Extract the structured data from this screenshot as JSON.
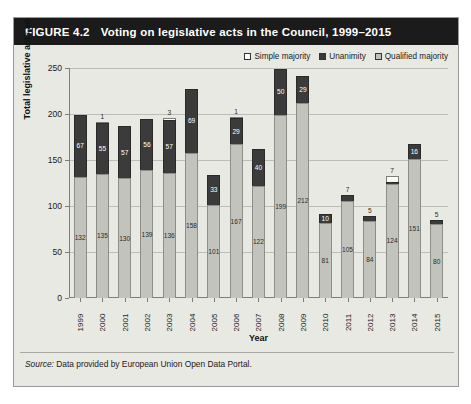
{
  "figure": {
    "number": "FIGURE 4.2",
    "title": "Voting on legislative acts in the Council, 1999–2015",
    "source_word": "Source:",
    "source_text": " Data provided by European Union Open Data Portal."
  },
  "legend": {
    "items": [
      {
        "label": "Simple majority",
        "color": "#ffffff",
        "key": "simple"
      },
      {
        "label": "Unanimity",
        "color": "#3a3a3a",
        "key": "unanimity"
      },
      {
        "label": "Qualified majority",
        "color": "#c0c0bb",
        "key": "qualified"
      }
    ]
  },
  "chart_data": {
    "type": "bar",
    "stacked": true,
    "title": "Voting on legislative acts in the Council, 1999–2015",
    "xlabel": "Year",
    "ylabel": "Total legislative acts adopted",
    "ylim": [
      0,
      250
    ],
    "yticks": [
      0,
      50,
      100,
      150,
      200,
      250
    ],
    "grid": true,
    "legend_position": "top-right",
    "categories": [
      "1999",
      "2000",
      "2001",
      "2002",
      "2003",
      "2004",
      "2005",
      "2006",
      "2007",
      "2008",
      "2009",
      "2010",
      "2011",
      "2012",
      "2013",
      "2014",
      "2015"
    ],
    "series": [
      {
        "name": "Qualified majority",
        "color": "#c3c3be",
        "values": [
          132,
          135,
          130,
          139,
          136,
          158,
          101,
          167,
          122,
          199,
          212,
          81,
          105,
          84,
          124,
          151,
          80
        ]
      },
      {
        "name": "Unanimity",
        "color": "#3b3b3b",
        "values": [
          67,
          55,
          57,
          56,
          57,
          69,
          33,
          29,
          40,
          50,
          29,
          10,
          7,
          5,
          2,
          16,
          5
        ]
      },
      {
        "name": "Simple majority",
        "color": "#fbfbf8",
        "values": [
          0,
          1,
          0,
          0,
          3,
          0,
          0,
          1,
          0,
          0,
          0,
          0,
          0,
          0,
          7,
          0,
          0
        ]
      }
    ],
    "totals": [
      199,
      191,
      187,
      195,
      196,
      227,
      134,
      197,
      162,
      249,
      241,
      91,
      112,
      89,
      133,
      167,
      85
    ]
  },
  "bars": [
    {
      "year": "1999",
      "qualified": 132,
      "unanimity": 67,
      "simple": 0,
      "qualified_label": "132",
      "unanimity_label": "67",
      "simple_label": ""
    },
    {
      "year": "2000",
      "qualified": 135,
      "unanimity": 55,
      "simple": 1,
      "qualified_label": "135",
      "unanimity_label": "55",
      "simple_label": "1"
    },
    {
      "year": "2001",
      "qualified": 130,
      "unanimity": 57,
      "simple": 0,
      "qualified_label": "130",
      "unanimity_label": "57",
      "simple_label": ""
    },
    {
      "year": "2002",
      "qualified": 139,
      "unanimity": 56,
      "simple": 0,
      "qualified_label": "139",
      "unanimity_label": "56",
      "simple_label": ""
    },
    {
      "year": "2003",
      "qualified": 136,
      "unanimity": 57,
      "simple": 3,
      "qualified_label": "136",
      "unanimity_label": "57",
      "simple_label": "3"
    },
    {
      "year": "2004",
      "qualified": 158,
      "unanimity": 69,
      "simple": 0,
      "qualified_label": "158",
      "unanimity_label": "69",
      "simple_label": ""
    },
    {
      "year": "2005",
      "qualified": 101,
      "unanimity": 33,
      "simple": 0,
      "qualified_label": "101",
      "unanimity_label": "33",
      "simple_label": ""
    },
    {
      "year": "2006",
      "qualified": 167,
      "unanimity": 29,
      "simple": 1,
      "qualified_label": "167",
      "unanimity_label": "29",
      "simple_label": "1"
    },
    {
      "year": "2007",
      "qualified": 122,
      "unanimity": 40,
      "simple": 0,
      "qualified_label": "122",
      "unanimity_label": "40",
      "simple_label": ""
    },
    {
      "year": "2008",
      "qualified": 199,
      "unanimity": 50,
      "simple": 0,
      "qualified_label": "199",
      "unanimity_label": "50",
      "simple_label": ""
    },
    {
      "year": "2009",
      "qualified": 212,
      "unanimity": 29,
      "simple": 0,
      "qualified_label": "212",
      "unanimity_label": "29",
      "simple_label": ""
    },
    {
      "year": "2010",
      "qualified": 81,
      "unanimity": 10,
      "simple": 0,
      "qualified_label": "81",
      "unanimity_label": "10",
      "simple_label": ""
    },
    {
      "year": "2011",
      "qualified": 105,
      "unanimity": 7,
      "simple": 0,
      "qualified_label": "105",
      "unanimity_label": "7",
      "simple_label": ""
    },
    {
      "year": "2012",
      "qualified": 84,
      "unanimity": 5,
      "simple": 0,
      "qualified_label": "84",
      "unanimity_label": "5",
      "simple_label": ""
    },
    {
      "year": "2013",
      "qualified": 124,
      "unanimity": 2,
      "simple": 7,
      "qualified_label": "124",
      "unanimity_label": "",
      "simple_label": "7"
    },
    {
      "year": "2014",
      "qualified": 151,
      "unanimity": 16,
      "simple": 0,
      "qualified_label": "151",
      "unanimity_label": "16",
      "simple_label": ""
    },
    {
      "year": "2015",
      "qualified": 80,
      "unanimity": 5,
      "simple": 0,
      "qualified_label": "80",
      "unanimity_label": "5",
      "simple_label": ""
    }
  ]
}
